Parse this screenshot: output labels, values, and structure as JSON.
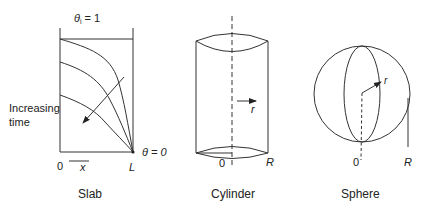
{
  "slab": {
    "caption": "Slab",
    "initial_label_theta": "θ",
    "initial_label_sub": "i",
    "initial_label_rest": " = 1",
    "boundary_label": "θ = 0",
    "side_label_line1": "Increasing",
    "side_label_line2": "time",
    "origin_label": "0",
    "axis_label": "x",
    "length_label": "L"
  },
  "cylinder": {
    "caption": "Cylinder",
    "radius_arrow_label": "r",
    "origin_label": "0",
    "radius_label": "R"
  },
  "sphere": {
    "caption": "Sphere",
    "radius_arrow_label": "r",
    "origin_label": "0",
    "radius_label": "R"
  },
  "colors": {
    "stroke": "#333333",
    "text": "#222222",
    "background": "#ffffff"
  }
}
